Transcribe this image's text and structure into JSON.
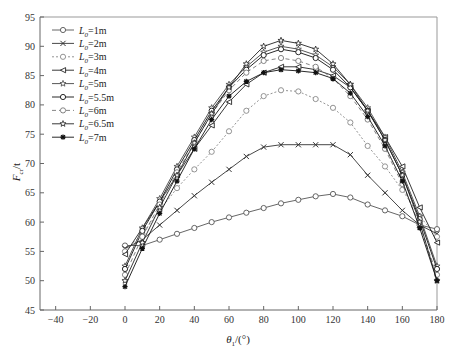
{
  "chart_data": {
    "type": "line",
    "title": "",
    "xlabel": "θ1/(°)",
    "ylabel": "Fcr/t",
    "xlim": [
      -50,
      180
    ],
    "ylim": [
      45,
      95
    ],
    "xticks": [
      -40,
      -20,
      0,
      20,
      40,
      60,
      80,
      100,
      120,
      140,
      160,
      180
    ],
    "yticks": [
      45,
      50,
      55,
      60,
      65,
      70,
      75,
      80,
      85,
      90,
      95
    ],
    "grid": false,
    "legend_position": "upper left",
    "x": [
      0,
      10,
      20,
      30,
      40,
      50,
      60,
      70,
      80,
      90,
      100,
      110,
      120,
      130,
      140,
      150,
      160,
      170,
      180
    ],
    "series": [
      {
        "name": "L0=1m",
        "marker": "circle",
        "color": "#555555",
        "dash": "",
        "values": [
          56.0,
          56.0,
          57.0,
          58.0,
          59.0,
          60.0,
          60.8,
          61.6,
          62.4,
          63.2,
          63.8,
          64.4,
          64.8,
          64.2,
          63.0,
          62.0,
          61.0,
          59.5,
          58.8
        ]
      },
      {
        "name": "L0=2m",
        "marker": "x",
        "color": "#333333",
        "dash": "",
        "values": [
          55.5,
          57.0,
          59.5,
          62.0,
          64.5,
          66.8,
          69.0,
          71.2,
          72.8,
          73.2,
          73.2,
          73.2,
          73.2,
          71.5,
          68.0,
          65.0,
          62.0,
          59.5,
          58.0
        ]
      },
      {
        "name": "L0=3m",
        "marker": "circle",
        "color": "#888888",
        "dash": "2,2",
        "values": [
          55.0,
          58.0,
          62.0,
          65.8,
          69.0,
          72.0,
          75.5,
          79.0,
          81.5,
          82.5,
          82.3,
          81.0,
          79.5,
          77.0,
          73.0,
          69.5,
          65.5,
          61.0,
          57.5
        ]
      },
      {
        "name": "L0=4m",
        "marker": "triangle-left",
        "color": "#222222",
        "dash": "",
        "values": [
          54.5,
          59.0,
          63.5,
          68.0,
          72.5,
          76.5,
          80.5,
          83.5,
          85.5,
          86.5,
          86.5,
          86.0,
          85.0,
          83.0,
          79.0,
          74.5,
          69.5,
          62.5,
          56.5
        ]
      },
      {
        "name": "L0=5m",
        "marker": "star",
        "color": "#444444",
        "dash": "",
        "values": [
          52.5,
          59.0,
          64.0,
          69.5,
          74.5,
          79.5,
          83.5,
          86.5,
          89.0,
          90.0,
          89.5,
          88.5,
          86.5,
          83.5,
          79.5,
          74.5,
          68.5,
          61.0,
          52.5
        ]
      },
      {
        "name": "L0=5.5m",
        "marker": "circle",
        "color": "#111111",
        "dash": "",
        "values": [
          52.0,
          58.5,
          63.5,
          69.0,
          74.0,
          79.0,
          83.0,
          86.0,
          88.5,
          89.5,
          89.0,
          88.0,
          86.0,
          83.0,
          79.0,
          74.0,
          68.0,
          60.5,
          52.0
        ]
      },
      {
        "name": "L0=6m",
        "marker": "circle",
        "color": "#777777",
        "dash": "4,3",
        "values": [
          51.0,
          57.5,
          63.0,
          68.5,
          73.5,
          78.5,
          82.5,
          85.5,
          87.5,
          88.0,
          87.5,
          86.5,
          84.5,
          81.5,
          77.5,
          72.5,
          66.5,
          59.5,
          51.0
        ]
      },
      {
        "name": "L0=6.5m",
        "marker": "star",
        "color": "#222222",
        "dash": "",
        "values": [
          50.0,
          56.5,
          62.5,
          68.0,
          73.5,
          78.5,
          83.0,
          87.0,
          90.0,
          91.0,
          90.5,
          89.5,
          87.0,
          83.5,
          79.0,
          74.0,
          68.0,
          60.0,
          50.0
        ]
      },
      {
        "name": "L0=7m",
        "marker": "asterisk",
        "color": "#111111",
        "dash": "",
        "values": [
          49.0,
          55.5,
          61.5,
          67.0,
          72.5,
          77.5,
          81.5,
          84.0,
          85.5,
          86.0,
          85.8,
          85.5,
          84.5,
          82.0,
          78.0,
          73.0,
          67.0,
          59.0,
          50.0
        ]
      }
    ]
  },
  "legend": {
    "items": [
      {
        "prefix": "L",
        "sub": "0",
        "suffix": "=1m"
      },
      {
        "prefix": "L",
        "sub": "0",
        "suffix": "=2m"
      },
      {
        "prefix": "L",
        "sub": "0",
        "suffix": "=3m"
      },
      {
        "prefix": "L",
        "sub": "0",
        "suffix": "=4m"
      },
      {
        "prefix": "L",
        "sub": "0",
        "suffix": "=5m"
      },
      {
        "prefix": "L",
        "sub": "0",
        "suffix": "=5.5m"
      },
      {
        "prefix": "L",
        "sub": "0",
        "suffix": "=6m"
      },
      {
        "prefix": "L",
        "sub": "0",
        "suffix": "=6.5m"
      },
      {
        "prefix": "L",
        "sub": "0",
        "suffix": "=7m"
      }
    ]
  },
  "axes": {
    "x_label_main": "θ",
    "x_label_sub": "1",
    "x_label_rest": "/(°)",
    "y_label_main": "F",
    "y_label_sub": "cr",
    "y_label_rest": "/t"
  }
}
